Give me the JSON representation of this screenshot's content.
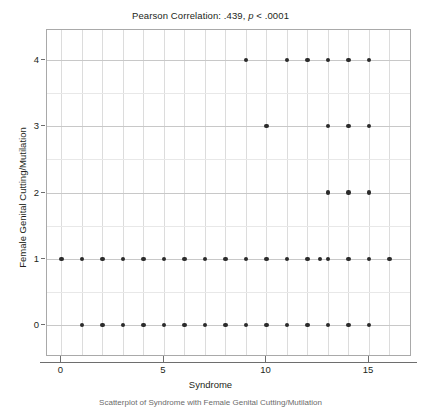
{
  "chart_data": {
    "type": "scatter",
    "title": "Pearson Correlation: .439, p < .0001",
    "title_prefix": "Pearson Correlation: .439, ",
    "title_italic": "p",
    "title_suffix": " < .0001",
    "xlabel": "Syndrome",
    "ylabel": "Female Genital Cutting/Mutilation",
    "caption": "Scatterplot of Syndrome with Female Genital Cutting/Mutilation",
    "correlation": ".439",
    "p_value": "< .0001",
    "xlim": [
      -0.7,
      17.0
    ],
    "ylim": [
      -0.45,
      4.45
    ],
    "xticks": [
      0,
      5,
      10,
      15
    ],
    "xtick_labels": [
      "0",
      "5",
      "10",
      "15"
    ],
    "yticks": [
      0,
      1,
      2,
      3,
      4
    ],
    "ytick_labels": [
      "0",
      "1",
      "2",
      "3",
      "4"
    ],
    "grid": true,
    "grid_color": "#dcdcdc",
    "marker_color": "#2b2b2b",
    "legend": "none",
    "points": [
      {
        "x": 1,
        "y": 0
      },
      {
        "x": 2,
        "y": 0
      },
      {
        "x": 3,
        "y": 0
      },
      {
        "x": 4,
        "y": 0
      },
      {
        "x": 5,
        "y": 0
      },
      {
        "x": 6,
        "y": 0
      },
      {
        "x": 7,
        "y": 0
      },
      {
        "x": 8,
        "y": 0
      },
      {
        "x": 9,
        "y": 0
      },
      {
        "x": 10,
        "y": 0
      },
      {
        "x": 11,
        "y": 0
      },
      {
        "x": 12,
        "y": 0
      },
      {
        "x": 13,
        "y": 0
      },
      {
        "x": 14,
        "y": 0
      },
      {
        "x": 15,
        "y": 0
      },
      {
        "x": 0,
        "y": 1
      },
      {
        "x": 1,
        "y": 1
      },
      {
        "x": 2,
        "y": 1
      },
      {
        "x": 3,
        "y": 1
      },
      {
        "x": 4,
        "y": 1
      },
      {
        "x": 5,
        "y": 1
      },
      {
        "x": 6,
        "y": 1
      },
      {
        "x": 7,
        "y": 1
      },
      {
        "x": 8,
        "y": 1
      },
      {
        "x": 9,
        "y": 1
      },
      {
        "x": 10,
        "y": 1
      },
      {
        "x": 11,
        "y": 1
      },
      {
        "x": 12,
        "y": 1
      },
      {
        "x": 12.6,
        "y": 1
      },
      {
        "x": 13,
        "y": 1
      },
      {
        "x": 14,
        "y": 1
      },
      {
        "x": 15,
        "y": 1
      },
      {
        "x": 16,
        "y": 1
      },
      {
        "x": 13,
        "y": 2
      },
      {
        "x": 14,
        "y": 2
      },
      {
        "x": 15,
        "y": 2
      },
      {
        "x": 10,
        "y": 3
      },
      {
        "x": 13,
        "y": 3
      },
      {
        "x": 14,
        "y": 3
      },
      {
        "x": 15,
        "y": 3
      },
      {
        "x": 9,
        "y": 4
      },
      {
        "x": 11,
        "y": 4
      },
      {
        "x": 12,
        "y": 4
      },
      {
        "x": 13,
        "y": 4
      },
      {
        "x": 14,
        "y": 4
      },
      {
        "x": 15,
        "y": 4
      }
    ]
  }
}
